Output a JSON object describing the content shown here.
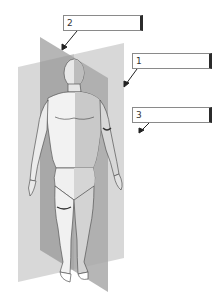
{
  "diagram": {
    "colors": {
      "background": "#ffffff",
      "plane_light": "#d4d4d4",
      "plane_dark": "#a8a8a8",
      "figure_skin": "#eeeeee",
      "outline": "#555555",
      "box_border": "#8a8a8a",
      "box_accent": "#2b2b2b"
    },
    "labels": [
      {
        "number": "2",
        "value": "",
        "placeholder": "",
        "target": "sagittal-plane-top-edge"
      },
      {
        "number": "1",
        "value": "",
        "placeholder": "",
        "target": "frontal-plane-right-edge"
      },
      {
        "number": "3",
        "value": "",
        "placeholder": "",
        "target": "transverse-region-right"
      }
    ]
  }
}
